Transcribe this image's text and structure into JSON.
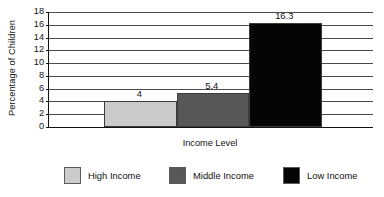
{
  "chart_data": {
    "type": "bar",
    "title": "",
    "xlabel": "Income Level",
    "ylabel": "Percentage of Children",
    "categories": [
      "High Income",
      "Middle Income",
      "Low Income"
    ],
    "values": [
      4,
      5.4,
      16.3
    ],
    "value_labels": [
      "4",
      "5.4",
      "16.3"
    ],
    "series": [
      {
        "name": "Percentage of Children",
        "values": [
          4,
          5.4,
          16.3
        ]
      }
    ],
    "ylim": [
      0,
      18
    ],
    "ytick_step": 2,
    "yticks": [
      0,
      2,
      4,
      6,
      8,
      10,
      12,
      14,
      16,
      18
    ],
    "ytick_labels": [
      "0",
      "2",
      "4",
      "6",
      "8",
      "10",
      "12",
      "14",
      "16",
      "18"
    ],
    "grid": true,
    "grid_axis": "y",
    "legend_position": "bottom",
    "bar_colors": [
      "#cbcbcb",
      "#575757",
      "#050505"
    ],
    "bar_border_color": "#3c3c3c",
    "axis_color": "#111111",
    "gridline_color": "#4b4b4b",
    "background_color": "#ffffff",
    "legend": [
      {
        "label": "High Income",
        "color": "#cbcbcb"
      },
      {
        "label": "Middle Income",
        "color": "#575757"
      },
      {
        "label": "Low Income",
        "color": "#050505"
      }
    ]
  }
}
